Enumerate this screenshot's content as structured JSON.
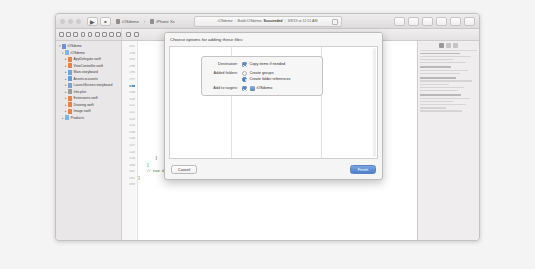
{
  "window": {
    "traffic_lights": [
      "close",
      "minimize",
      "zoom"
    ],
    "toolbar": {
      "run_label": "▶",
      "stop_label": "■",
      "scheme_name": "iOSdemo",
      "device_name": "iPhone Xs",
      "scheme_separator": "›"
    },
    "status": {
      "project": "iOSdemo",
      "action": "Build iOSdemo",
      "result": "Succeeded",
      "timestamp": "3/8/19 at 11:51 AM",
      "divider": "|"
    }
  },
  "navigator": {
    "items": [
      {
        "label": "iOSdemo",
        "icon": "proj-icon",
        "depth": 0,
        "expanded": true,
        "kind": "proj"
      },
      {
        "label": "iOSdemo",
        "icon": "folder-icon",
        "depth": 1,
        "expanded": true,
        "kind": "folder"
      },
      {
        "label": "AppDelegate.swift",
        "icon": "swift-icon",
        "depth": 2,
        "expanded": false,
        "kind": "swift"
      },
      {
        "label": "ViewController.swift",
        "icon": "swift-icon",
        "depth": 2,
        "expanded": false,
        "kind": "swift"
      },
      {
        "label": "Main.storyboard",
        "icon": "storyboard-icon",
        "depth": 2,
        "expanded": false,
        "kind": "storyb"
      },
      {
        "label": "Assets.xcassets",
        "icon": "assets-icon",
        "depth": 2,
        "expanded": false,
        "kind": "asset"
      },
      {
        "label": "LaunchScreen.storyboard",
        "icon": "storyboard-icon",
        "depth": 2,
        "expanded": false,
        "kind": "storyb"
      },
      {
        "label": "Info.plist",
        "icon": "plist-icon",
        "depth": 2,
        "expanded": false,
        "kind": "plist"
      },
      {
        "label": "Extensions.swift",
        "icon": "swift-icon",
        "depth": 2,
        "expanded": false,
        "kind": "swift"
      },
      {
        "label": "Drawing.swift",
        "icon": "swift-icon",
        "depth": 2,
        "expanded": false,
        "kind": "swift"
      },
      {
        "label": "Image.swift",
        "icon": "swift-icon",
        "depth": 2,
        "expanded": false,
        "kind": "swift"
      },
      {
        "label": "Products",
        "icon": "folder-icon",
        "depth": 1,
        "expanded": false,
        "kind": "folder"
      }
    ]
  },
  "editor": {
    "line_numbers": [
      "132",
      "133",
      "134",
      "135",
      "136",
      "137",
      "138",
      "139",
      "140",
      "141",
      "142",
      "143",
      "144",
      "145",
      "146",
      "147",
      "148",
      "149",
      "150",
      "151",
      "152",
      "153"
    ],
    "current_line": "138",
    "visible_code": [
      {
        "line": "148",
        "text": "            }"
      },
      {
        "line": "149",
        "text": "        }"
      },
      {
        "line": "150",
        "text": "    }"
      },
      {
        "line": "151",
        "text": "    // END dd_new_classify"
      },
      {
        "line": "152",
        "text": "}"
      },
      {
        "line": "153",
        "text": ""
      }
    ],
    "code_comment": "// END dd_new_classify",
    "code_fragment_right": "er: .noir) else"
  },
  "sheet": {
    "title": "Choose options for adding these files:",
    "options": [
      {
        "label": "Destination:",
        "type": "checkbox",
        "checked": true,
        "text": "Copy items if needed"
      },
      {
        "label": "Added folders:",
        "type": "radio-group",
        "choices": [
          {
            "text": "Create groups",
            "selected": false
          },
          {
            "text": "Create folder references",
            "selected": true
          }
        ]
      },
      {
        "label": "Add to targets:",
        "type": "target-list",
        "targets": [
          {
            "name": "iOSdemo",
            "checked": true
          }
        ]
      }
    ],
    "buttons": {
      "cancel": "Cancel",
      "finish": "Finish"
    }
  },
  "inspector": {
    "tabs": [
      "file-inspector",
      "quick-help",
      "identity-inspector"
    ],
    "active_tab_index": 0
  },
  "colors": {
    "accent": "#3a72be",
    "primary_button": "#4b7fcc",
    "swift_icon": "#e8804a",
    "folder_icon": "#7fb3e8",
    "comment_green": "#3c7a3c",
    "window_chrome": "#eceaea"
  }
}
